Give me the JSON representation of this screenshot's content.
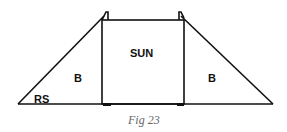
{
  "figure": {
    "caption": "Fig 23",
    "labels": {
      "center": "SUN",
      "left_triangle": "B",
      "right_triangle": "B",
      "corner": "RS"
    },
    "colors": {
      "stroke": "#111111",
      "caption": "#666666",
      "background": "#ffffff"
    }
  }
}
